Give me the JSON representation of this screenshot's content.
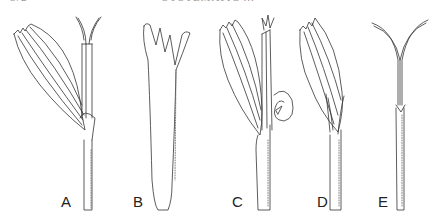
{
  "running_header": {
    "page_number": "372",
    "title": "SYSTEMATIC ..."
  },
  "figure": {
    "type": "botanical line illustration",
    "panels": [
      {
        "label": "A",
        "x": 61,
        "y": 194
      },
      {
        "label": "B",
        "x": 133,
        "y": 194
      },
      {
        "label": "C",
        "x": 232,
        "y": 194
      },
      {
        "label": "D",
        "x": 317,
        "y": 194
      },
      {
        "label": "E",
        "x": 378,
        "y": 194
      }
    ]
  }
}
